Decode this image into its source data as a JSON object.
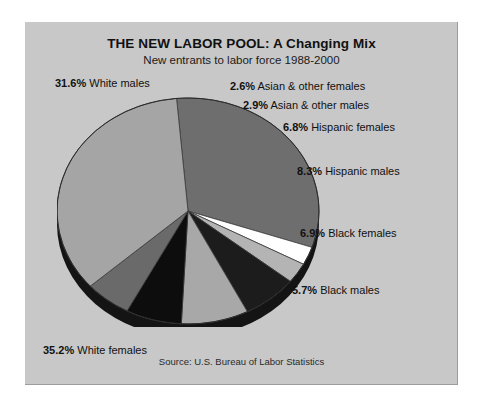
{
  "chart_data": {
    "type": "pie",
    "title": "THE NEW LABOR POOL: A Changing Mix",
    "subtitle": "New entrants to labor force 1988-2000",
    "source": "Source: U.S. Bureau of Labor Statistics",
    "xlabel": "",
    "ylabel": "",
    "legend_position": "callout-labels",
    "grid": false,
    "categories": [
      "White males",
      "Asian & other females",
      "Asian & other males",
      "Hispanic females",
      "Hispanic males",
      "Black females",
      "Black males",
      "White females"
    ],
    "values": [
      31.6,
      2.6,
      2.9,
      6.8,
      8.3,
      6.9,
      5.7,
      35.2
    ],
    "unit": "%",
    "total": 100.0,
    "slices": [
      {
        "label": "White males",
        "value": 31.6,
        "value_text": "31.6%",
        "color": "#6e6e6e"
      },
      {
        "label": "Asian & other females",
        "value": 2.6,
        "value_text": "2.6%",
        "color": "#ffffff"
      },
      {
        "label": "Asian & other males",
        "value": 2.9,
        "value_text": "2.9%",
        "color": "#b4b4b4"
      },
      {
        "label": "Hispanic females",
        "value": 6.8,
        "value_text": "6.8%",
        "color": "#1c1c1c"
      },
      {
        "label": "Hispanic males",
        "value": 8.3,
        "value_text": "8.3%",
        "color": "#a8a8a8"
      },
      {
        "label": "Black females",
        "value": 6.9,
        "value_text": "6.9%",
        "color": "#0d0d0d"
      },
      {
        "label": "Black males",
        "value": 5.7,
        "value_text": "5.7%",
        "color": "#6a6a6a"
      },
      {
        "label": "White females",
        "value": 35.2,
        "value_text": "35.2%",
        "color": "#a5a5a5"
      }
    ],
    "colors": {
      "background": "#c8c8c8",
      "page": "#ffffff",
      "rim": "#141414",
      "text": "#111111"
    }
  },
  "labels": {
    "white_males_pct": "31.6%",
    "white_males_name": "White  males",
    "asian_females_pct": "2.6%",
    "asian_females_name": "Asian & other females",
    "asian_males_pct": "2.9%",
    "asian_males_name": "Asian & other males",
    "hispanic_females_pct": "6.8%",
    "hispanic_females_name": "Hispanic females",
    "hispanic_males_pct": "8.3%",
    "hispanic_males_name": "Hispanic males",
    "black_females_pct": "6.9%",
    "black_females_name": "Black females",
    "black_males_pct": "5.7%",
    "black_males_name": "Black males",
    "white_females_pct": "35.2%",
    "white_females_name": "White females"
  }
}
